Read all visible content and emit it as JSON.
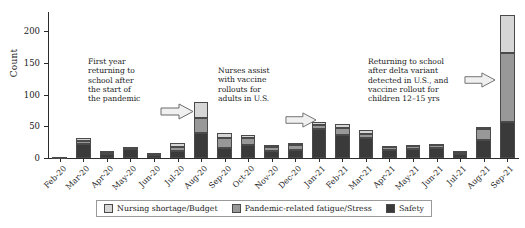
{
  "chart_data": {
    "type": "bar",
    "title": "",
    "subtitle": "",
    "xlabel": "",
    "ylabel": "Count",
    "ylim": [
      0,
      230
    ],
    "yticks": [
      0,
      50,
      100,
      150,
      200
    ],
    "ytick_labels": [
      "0",
      "50",
      "100",
      "150",
      "200"
    ],
    "grid": false,
    "stacked": true,
    "legend_position": "bottom",
    "categories": [
      "Feb-20",
      "Mar-20",
      "Apr-20",
      "May-20",
      "Jun-20",
      "Jul-20",
      "Aug-20",
      "Sep-20",
      "Oct-20",
      "Nov-20",
      "Dec-20",
      "Jan-21",
      "Feb-21",
      "Mar-21",
      "Apr-21",
      "May-21",
      "Jun-21",
      "Jul-21",
      "Aug-21",
      "Sep-21"
    ],
    "series": [
      {
        "name": "Safety",
        "color": "#3a3a3a",
        "values": [
          1,
          22,
          6,
          14,
          5,
          11,
          39,
          16,
          20,
          11,
          13,
          45,
          36,
          31,
          12,
          14,
          15,
          6,
          28,
          57
        ]
      },
      {
        "name": "Pandemic-related fatigue/Stress",
        "color": "#989898",
        "values": [
          0,
          5,
          3,
          2,
          2,
          7,
          24,
          15,
          12,
          6,
          7,
          7,
          12,
          7,
          5,
          5,
          5,
          4,
          17,
          108
        ]
      },
      {
        "name": "Nursing shortage/Budget",
        "color": "#d6d6d6",
        "values": [
          0,
          4,
          2,
          1,
          1,
          5,
          25,
          8,
          5,
          4,
          3,
          5,
          6,
          6,
          2,
          2,
          2,
          1,
          4,
          60
        ]
      }
    ],
    "totals": [
      1,
      31,
      11,
      17,
      8,
      23,
      88,
      39,
      37,
      21,
      23,
      57,
      54,
      44,
      19,
      21,
      22,
      11,
      49,
      225
    ],
    "annotations": [
      {
        "id": "annotation-first-year",
        "lines": [
          "First year",
          "returning to",
          "school after",
          "the start of",
          "the pandemic"
        ],
        "arrow": "right-arrow-icon",
        "points_to": "Aug-20"
      },
      {
        "id": "annotation-vaccine-rollout",
        "lines": [
          "Nurses assist",
          "with vaccine",
          "rollouts for",
          "adults in U.S."
        ],
        "arrow": "right-arrow-icon",
        "points_to": "Jan-21"
      },
      {
        "id": "annotation-delta-variant",
        "lines": [
          "Returning to school",
          "after delta variant",
          "detected in U.S., and",
          "vaccine rollout for",
          "children 12–15 yrs"
        ],
        "arrow": "right-arrow-icon",
        "points_to": "Sep-21"
      }
    ],
    "legend": [
      {
        "label": "Nursing shortage/Budget",
        "color": "#d6d6d6"
      },
      {
        "label": "Pandemic-related fatigue/Stress",
        "color": "#989898"
      },
      {
        "label": "Safety",
        "color": "#3a3a3a"
      }
    ]
  }
}
